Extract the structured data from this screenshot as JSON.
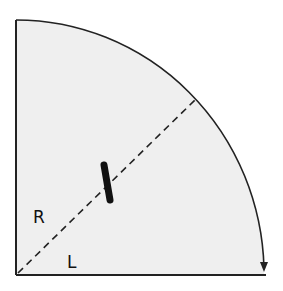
{
  "diagram": {
    "type": "quarter-circle sector",
    "labels": {
      "radius": "R",
      "length": "L"
    },
    "colors": {
      "fill": "#efefef",
      "stroke": "#222222",
      "background": "#ffffff"
    },
    "elements": [
      "quarter-circle region",
      "vertical edge",
      "horizontal edge",
      "arc with arrowhead",
      "dashed diagonal from corner",
      "thick bar across diagonal"
    ]
  }
}
